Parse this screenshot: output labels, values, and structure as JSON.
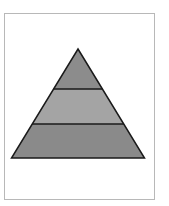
{
  "diagram": {
    "type": "pyramid",
    "levels": [
      {
        "position": "top",
        "label": "",
        "fill": "#8c8c8c"
      },
      {
        "position": "middle",
        "label": "",
        "fill": "#a4a4a4"
      },
      {
        "position": "bottom",
        "label": "",
        "fill": "#8a8a8a"
      }
    ],
    "outline_color": "#1a1a1a",
    "frame_border_color": "#b8b8b8"
  }
}
